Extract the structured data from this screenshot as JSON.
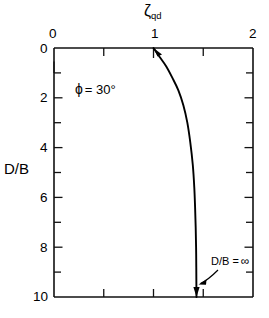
{
  "chart_data": {
    "type": "line",
    "title": "",
    "xlabel": "ζqd",
    "xlabel_base": "ζ",
    "xlabel_sub": "qd",
    "ylabel": "D/B",
    "xlim": [
      0,
      2
    ],
    "ylim": [
      0,
      10
    ],
    "y_inverted": true,
    "x_axis_position": "top",
    "grid": false,
    "legend": "none",
    "xticks": [
      0,
      1,
      2
    ],
    "xtick_labels": [
      "0",
      "1",
      "2"
    ],
    "x_minor_ticks": [
      0.5,
      1.5
    ],
    "yticks": [
      0,
      2,
      4,
      6,
      8,
      10
    ],
    "ytick_labels": [
      "0",
      "2",
      "4",
      "6",
      "8",
      "10"
    ],
    "y_minor_ticks": [
      1,
      3,
      5,
      7,
      9
    ],
    "series": [
      {
        "name": "zeta_qd vs D/B",
        "x": [
          1.0,
          1.06,
          1.13,
          1.19,
          1.25,
          1.3,
          1.34,
          1.37,
          1.395,
          1.41,
          1.418,
          1.424,
          1.428,
          1.43,
          1.431,
          1.432
        ],
        "y": [
          0.0,
          0.35,
          0.75,
          1.2,
          1.7,
          2.3,
          3.0,
          3.8,
          4.7,
          5.6,
          6.4,
          7.2,
          8.0,
          8.8,
          9.5,
          10.0
        ]
      }
    ],
    "annotations": [
      {
        "name": "friction-angle",
        "text": "ϕ = 30°",
        "symbol": "ϕ",
        "equals": "=",
        "value": "30°",
        "x": 0.42,
        "y": 1.85
      },
      {
        "name": "asymptote-label",
        "text": "D/B = ∞",
        "x": 1.55,
        "y": 8.9,
        "points_to_x": 1.432,
        "points_to_y": 10.0
      }
    ]
  },
  "labels": {
    "top_axis_title_base": "ζ",
    "top_axis_title_sub": "qd",
    "y_axis_title": "D/B",
    "xtick_0": "0",
    "xtick_1": "1",
    "xtick_2": "2",
    "ytick_0": "0",
    "ytick_2": "2",
    "ytick_4": "4",
    "ytick_6": "6",
    "ytick_8": "8",
    "ytick_10": "10",
    "phi_symbol": "ϕ",
    "phi_eq": "= 30°",
    "db_inf": "D/B =",
    "inf_symbol": "∞"
  },
  "colors": {
    "ink": "#111111",
    "curve": "#000000",
    "background": "#ffffff"
  }
}
